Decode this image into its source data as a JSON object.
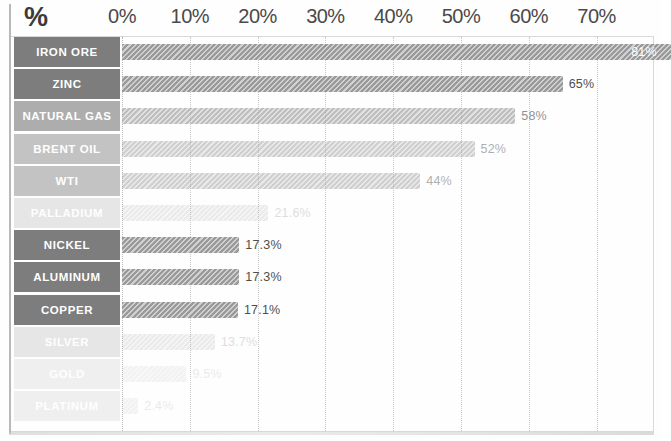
{
  "chart_data": {
    "type": "bar",
    "orientation": "horizontal",
    "title": "%",
    "xlabel": "",
    "ylabel": "",
    "xlim": [
      0,
      75
    ],
    "grid": true,
    "legend": false,
    "axis_unit": "%",
    "tick_labels": [
      "0%",
      "10%",
      "20%",
      "30%",
      "40%",
      "50%",
      "60%",
      "70%"
    ],
    "tick_values": [
      0,
      10,
      20,
      30,
      40,
      50,
      60,
      70
    ],
    "categories": [
      "IRON ORE",
      "ZINC",
      "NATURAL GAS",
      "BRENT OIL",
      "WTI",
      "PALLADIUM",
      "NICKEL",
      "ALUMINUM",
      "COPPER",
      "SILVER",
      "GOLD",
      "PLATINUM"
    ],
    "values": [
      81,
      65,
      58,
      52,
      44,
      21.6,
      17.3,
      17.3,
      17.1,
      13.7,
      9.5,
      2.4
    ],
    "data_labels": [
      "81%",
      "65%",
      "58%",
      "52%",
      "44%",
      "21.6%",
      "17.3%",
      "17.3%",
      "17.1%",
      "13.7%",
      "9.5%",
      "2.4%"
    ],
    "label_placement": [
      "inside",
      "outside",
      "outside",
      "outside",
      "outside",
      "outside",
      "outside",
      "outside",
      "outside",
      "outside",
      "outside",
      "outside"
    ],
    "bar_color": "#9a9a9a",
    "category_cell_color": "#7d7d7d",
    "fade_levels": [
      1,
      1,
      3,
      4,
      4,
      6,
      1,
      1,
      1,
      6,
      7,
      7
    ]
  }
}
